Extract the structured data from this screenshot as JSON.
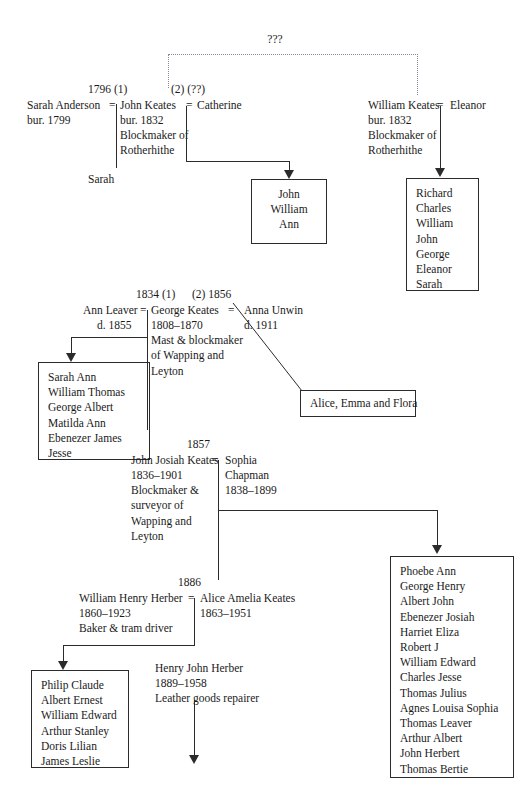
{
  "unknown_ancestor": {
    "label": "???"
  },
  "generation1": {
    "union_left": {
      "marriage_note": "1796 (1)",
      "spouse_left_name": "Sarah Anderson",
      "spouse_left_detail": "bur. 1799",
      "equals": "=",
      "person_name": "John Keates",
      "person_lines": "bur. 1832\nBlockmaker of\nRotherhithe",
      "child_single": "Sarah"
    },
    "union_right": {
      "marriage_note": "(2) (??)",
      "equals": "=",
      "spouse_name": "Catherine",
      "children_box": "John\nWilliam\nAnn"
    },
    "william_branch": {
      "person_name": "William Keates",
      "equals": "=",
      "spouse_name": "Eleanor",
      "person_lines": "bur. 1832\nBlockmaker of\nRotherhithe",
      "children_box": "Richard\nCharles\nWilliam\nJohn\nGeorge\nEleanor\nSarah"
    }
  },
  "generation2": {
    "marriage_note_left": "1834 (1)",
    "marriage_note_right": "(2) 1856",
    "spouse_left_name": "Ann Leaver",
    "spouse_left_detail": "d. 1855",
    "equals_left": "=",
    "person_name": "George Keates",
    "person_lines": "1808–1870\nMast & blockmaker\nof Wapping and\nLeyton",
    "equals_right": "=",
    "spouse_right_name": "Anna Unwin",
    "spouse_right_detail": "d. 1911",
    "children_box_left": "Sarah Ann\nWilliam Thomas\nGeorge Albert\nMatilda Ann\nEbenezer James\nJesse",
    "children_box_right": "Alice, Emma and Flora"
  },
  "generation3": {
    "marriage_note": "1857",
    "person_name": "John Josiah Keates",
    "person_lines": "1836–1901\nBlockmaker &\nsurveyor of\nWapping and\nLeyton",
    "equals": "=",
    "spouse_name": "Sophia",
    "spouse_lines": "Chapman\n1838–1899",
    "children_box": "Phoebe Ann\nGeorge Henry\nAlbert John\nEbenezer Josiah\nHarriet Eliza\nRobert J\nWilliam Edward\nCharles Jesse\nThomas Julius\nAgnes Louisa Sophia\nThomas Leaver\nArthur Albert\nJohn Herbert\nThomas Bertie"
  },
  "generation4": {
    "marriage_note": "1886",
    "person_name": "William Henry Herber",
    "person_lines": "1860–1923\nBaker & tram driver",
    "equals": "=",
    "spouse_name": "Alice Amelia Keates",
    "spouse_detail": "1863–1951",
    "children_box": "Philip Claude\nAlbert Ernest\nWilliam Edward\nArthur Stanley\nDoris Lilian\nJames Leslie",
    "child_named": "Henry John Herber",
    "child_lines": "1889–1958\nLeather goods repairer"
  },
  "colors": {
    "line": "#2b2b2b",
    "dotted": "#8a8a99",
    "text": "#1a1a1a",
    "background": "#ffffff"
  }
}
